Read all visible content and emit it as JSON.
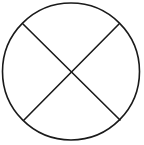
{
  "diagram": {
    "canvas": {
      "width": 144,
      "height": 145,
      "background": "#ffffff"
    },
    "stroke_color": "#1a1a1a",
    "stroke_width": 1.6,
    "circle": {
      "cx": 71,
      "cy": 71.5,
      "r": 68.5
    },
    "lines": [
      {
        "name": "diagonal-line-tl-br",
        "x1": 23,
        "y1": 24,
        "x2": 120,
        "y2": 120
      },
      {
        "name": "diagonal-line-tr-bl",
        "x1": 119,
        "y1": 24,
        "x2": 24,
        "y2": 120
      }
    ]
  }
}
